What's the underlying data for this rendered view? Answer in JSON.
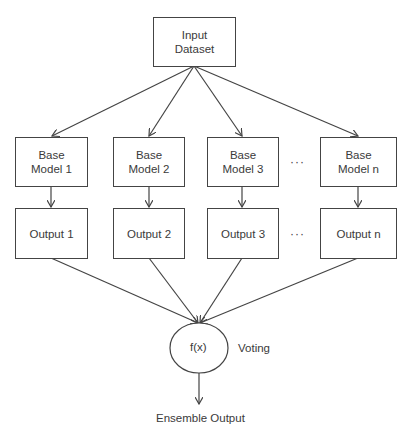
{
  "input": {
    "label_line1": "Input",
    "label_line2": "Dataset"
  },
  "models": [
    {
      "line1": "Base",
      "line2": "Model 1",
      "output": "Output 1"
    },
    {
      "line1": "Base",
      "line2": "Model 2",
      "output": "Output 2"
    },
    {
      "line1": "Base",
      "line2": "Model 3",
      "output": "Output 3"
    },
    {
      "line1": "Base",
      "line2": "Model n",
      "output": "Output n"
    }
  ],
  "ellipsis": "···",
  "combiner": {
    "label": "f(x)",
    "annotation": "Voting"
  },
  "result": {
    "label": "Ensemble Output"
  },
  "colors": {
    "stroke": "#444444",
    "text": "#3a3a3a"
  }
}
